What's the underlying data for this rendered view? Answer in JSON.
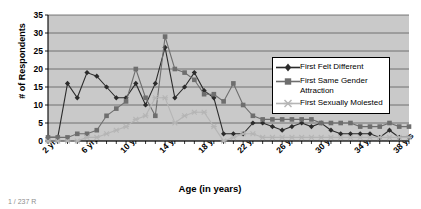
{
  "chart_data": {
    "type": "line",
    "title": "",
    "xlabel": "Age (in years)",
    "ylabel": "# of Respondents",
    "ylim": [
      0,
      35
    ],
    "yticks": [
      0,
      5,
      10,
      15,
      20,
      25,
      30,
      35
    ],
    "xlim": [
      2,
      39
    ],
    "xticks": [
      2,
      6,
      10,
      14,
      18,
      22,
      26,
      30,
      34,
      38
    ],
    "xticklabels": [
      "2 yrs",
      "6 yrs",
      "10 yrs",
      "14 yrs",
      "18 yrs",
      "22 yrs",
      "26 yrs",
      "30 yrs",
      "34 yrs",
      "38 yrs"
    ],
    "grid": "horizontal",
    "plot_background": "#c9c9c9",
    "legend_position": "center-right",
    "x": [
      2,
      3,
      4,
      5,
      6,
      7,
      8,
      9,
      10,
      11,
      12,
      13,
      14,
      15,
      16,
      17,
      18,
      19,
      20,
      21,
      22,
      23,
      24,
      25,
      26,
      27,
      28,
      29,
      30,
      31,
      32,
      33,
      34,
      35,
      36,
      37,
      38,
      39
    ],
    "series": [
      {
        "name": "First Felt Different",
        "color": "#2b2b2b",
        "marker": "diamond",
        "values": [
          1,
          1,
          16,
          12,
          19,
          18,
          15,
          12,
          12,
          16,
          10,
          16,
          26,
          12,
          15,
          19,
          14,
          12,
          2,
          2,
          2,
          5,
          5,
          4,
          3,
          4,
          5,
          4,
          5,
          3,
          2,
          2,
          2,
          2,
          1,
          3,
          1,
          1
        ]
      },
      {
        "name": "First Same Gender Attraction",
        "color": "#6e6e6e",
        "marker": "square",
        "values": [
          1,
          1,
          1,
          2,
          2,
          3,
          7,
          9,
          11,
          20,
          12,
          7,
          29,
          20,
          19,
          17,
          13,
          13,
          11,
          16,
          10,
          7,
          6,
          6,
          6,
          6,
          6,
          6,
          5,
          5,
          5,
          5,
          4,
          4,
          4,
          5,
          4,
          4
        ]
      },
      {
        "name": "First Sexually Molested",
        "color": "#b5b5b5",
        "marker": "star",
        "values": [
          0,
          0,
          0,
          0,
          1,
          1,
          2,
          3,
          4,
          6,
          7,
          12,
          12,
          5,
          7,
          8,
          8,
          4,
          0,
          1,
          2,
          2,
          1,
          1,
          1,
          1,
          1,
          1,
          1,
          1,
          1,
          1,
          1,
          1,
          1,
          1,
          1,
          1
        ]
      }
    ]
  },
  "footnote": {
    "text": "1 / 237 R"
  }
}
